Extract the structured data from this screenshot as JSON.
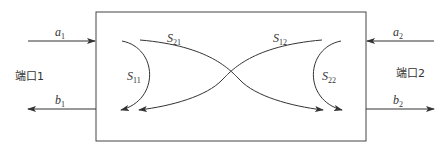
{
  "diagram": {
    "ports": [
      {
        "label": "端口1",
        "incident": {
          "base": "a",
          "sub": "1"
        },
        "reflected": {
          "base": "b",
          "sub": "1"
        }
      },
      {
        "label": "端口2",
        "incident": {
          "base": "a",
          "sub": "2"
        },
        "reflected": {
          "base": "b",
          "sub": "2"
        }
      }
    ],
    "s_params": {
      "s11": {
        "base": "S",
        "sub": "11"
      },
      "s21": {
        "base": "S",
        "sub": "21"
      },
      "s12": {
        "base": "S",
        "sub": "12"
      },
      "s22": {
        "base": "S",
        "sub": "22"
      }
    },
    "colors": {
      "line": "#333333",
      "background": "#ffffff"
    }
  }
}
